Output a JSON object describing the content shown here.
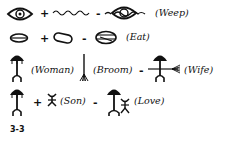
{
  "figure_label": "3-3",
  "rows": [
    {
      "components": [
        "eye-icon",
        "water-waves-icon"
      ],
      "result": "eye-with-tears-icon",
      "operators": [
        "+",
        "-"
      ],
      "meaning": "(Weep)"
    },
    {
      "components": [
        "mouth-icon",
        "food-icon"
      ],
      "result": "mouth-with-food-icon",
      "operators": [
        "+",
        "-"
      ],
      "meaning": "(Eat)"
    },
    {
      "components": [
        "woman-icon",
        "broom-icon"
      ],
      "component_labels": [
        "(Woman)",
        "(Broom)"
      ],
      "result": "wife-icon",
      "operators": [
        "-"
      ],
      "meaning": "(Wife)"
    },
    {
      "components": [
        "woman-icon",
        "son-icon"
      ],
      "component_labels": [
        "(Son)"
      ],
      "result": "woman-with-son-icon",
      "operators": [
        "+",
        "-"
      ],
      "meaning": "(Love)"
    }
  ],
  "colors": {
    "ink": "#111111",
    "paper": "#ffffff"
  }
}
